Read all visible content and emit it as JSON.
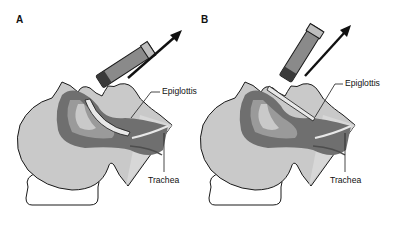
{
  "figure": {
    "panels": [
      {
        "id": "A",
        "letter": "A",
        "labels": {
          "epiglottis": "Epiglottis",
          "trachea": "Trachea"
        },
        "blade_position": "vallecula (curved blade tip anterior to epiglottis)"
      },
      {
        "id": "B",
        "letter": "B",
        "labels": {
          "epiglottis": "Epiglottis",
          "trachea": "Trachea"
        },
        "blade_position": "straight blade lifting epiglottis"
      }
    ],
    "colors": {
      "head_fill": "#c9c9c9",
      "airway_dark": "#6f6f6f",
      "airway_mid": "#9a9a9a",
      "outline": "#1a1a1a",
      "handle": "#8a8a8a",
      "arrow": "#111111",
      "background": "#ffffff"
    }
  }
}
